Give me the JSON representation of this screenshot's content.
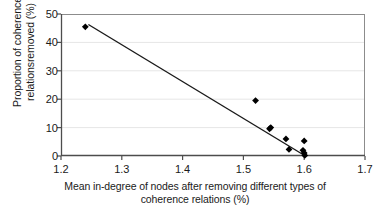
{
  "chart_data": {
    "type": "scatter",
    "title": "",
    "xlabel": "Mean in-degree of nodes after removing different types of coherence relations (%)",
    "xlabel_line1": "Mean in-degree of nodes after removing different types of",
    "xlabel_line2": "coherence relations (%)",
    "ylabel": "Proportion of coherence relationsremoved (%)",
    "ylabel_line1": "Proportion of coherence",
    "ylabel_line2": "relationsremoved (%)",
    "xlim": [
      1.2,
      1.7
    ],
    "ylim": [
      0,
      50
    ],
    "xticks": [
      "1.2",
      "1.3",
      "1.4",
      "1.5",
      "1.6",
      "1.7"
    ],
    "xtick_values": [
      1.2,
      1.3,
      1.4,
      1.5,
      1.6,
      1.7
    ],
    "yticks": [
      "0",
      "10",
      "20",
      "30",
      "40",
      "50"
    ],
    "ytick_values": [
      0,
      10,
      20,
      30,
      40,
      50
    ],
    "grid": "horizontal",
    "legend": "none",
    "marker": "diamond",
    "marker_color": "#000000",
    "line_color": "#1a1a1a",
    "points": [
      {
        "x": 1.24,
        "y": 45.5
      },
      {
        "x": 1.52,
        "y": 19.5
      },
      {
        "x": 1.545,
        "y": 10.0
      },
      {
        "x": 1.543,
        "y": 9.6
      },
      {
        "x": 1.57,
        "y": 6.0
      },
      {
        "x": 1.575,
        "y": 2.3
      },
      {
        "x": 1.6,
        "y": 5.3
      },
      {
        "x": 1.598,
        "y": 2.0
      },
      {
        "x": 1.6,
        "y": 1.1
      },
      {
        "x": 1.601,
        "y": 0.2
      }
    ],
    "trendline": {
      "x0": 1.245,
      "y0": 46.3,
      "x1": 1.602,
      "y1": 0.0
    }
  }
}
